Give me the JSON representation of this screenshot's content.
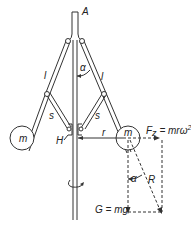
{
  "diagram": {
    "labels": {
      "point_a": "A",
      "angle_upper": "α",
      "arm_left_l": "l",
      "arm_right_l": "l",
      "link_left_s": "s",
      "link_right_s": "s",
      "mass_left": "m",
      "mass_right": "m",
      "sleeve_h": "H",
      "radius_r": "r",
      "centrifugal_force": "F",
      "centrifugal_sub": "z",
      "centrifugal_eq": " = mrω",
      "centrifugal_sup": "2",
      "angle_lower": "α",
      "resultant_r": "R",
      "weight": "G = mg"
    },
    "colors": {
      "line": "#333333",
      "background": "#ffffff"
    }
  }
}
